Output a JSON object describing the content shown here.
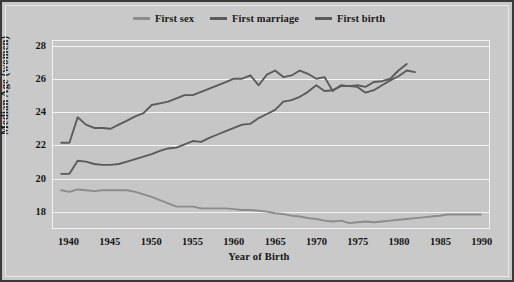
{
  "chart_data": {
    "type": "line",
    "title": "",
    "xlabel": "Year of Birth",
    "ylabel": "Median Age (women)",
    "xlim": [
      1938,
      1991
    ],
    "ylim": [
      16.9,
      28.3
    ],
    "yticks": [
      28,
      26,
      24,
      22,
      20,
      18
    ],
    "xticks": [
      1940,
      1945,
      1950,
      1955,
      1960,
      1965,
      1970,
      1975,
      1980,
      1985,
      1990
    ],
    "grid": "horizontal",
    "legend_position": "top-center",
    "colors": {
      "first_sex": "#8c8c8c",
      "first_marriage": "#5b5b5b",
      "first_birth": "#5b5b5b",
      "plot_background": "#c6c6c6",
      "figure_background": "#c9c9c9",
      "gridline": "#f4f4f4",
      "frame_border": "#3a3a3a",
      "text": "#161616"
    },
    "series": [
      {
        "name": "First sex",
        "color": "#8c8c8c",
        "x": [
          1939,
          1940,
          1941,
          1942,
          1943,
          1944,
          1945,
          1946,
          1947,
          1948,
          1949,
          1950,
          1951,
          1952,
          1953,
          1954,
          1955,
          1956,
          1957,
          1958,
          1959,
          1960,
          1961,
          1962,
          1963,
          1964,
          1965,
          1966,
          1967,
          1968,
          1969,
          1970,
          1971,
          1972,
          1973,
          1974,
          1975,
          1976,
          1977,
          1978,
          1979,
          1980,
          1981,
          1982,
          1983,
          1984,
          1985,
          1986,
          1987,
          1988,
          1989,
          1990
        ],
        "values": [
          19.2,
          19.1,
          19.25,
          19.2,
          19.15,
          19.2,
          19.2,
          19.2,
          19.2,
          19.1,
          18.95,
          18.8,
          18.6,
          18.4,
          18.2,
          18.2,
          18.2,
          18.1,
          18.1,
          18.1,
          18.1,
          18.05,
          18.0,
          18.0,
          17.95,
          17.9,
          17.8,
          17.75,
          17.65,
          17.6,
          17.5,
          17.45,
          17.35,
          17.3,
          17.35,
          17.2,
          17.25,
          17.3,
          17.25,
          17.3,
          17.35,
          17.4,
          17.45,
          17.5,
          17.55,
          17.6,
          17.65,
          17.72,
          17.72,
          17.72,
          17.72,
          17.72
        ]
      },
      {
        "name": "First marriage",
        "color": "#5b5b5b",
        "x": [
          1939,
          1940,
          1941,
          1942,
          1943,
          1944,
          1945,
          1946,
          1947,
          1948,
          1949,
          1950,
          1951,
          1952,
          1953,
          1954,
          1955,
          1956,
          1957,
          1958,
          1959,
          1960,
          1961,
          1962,
          1963,
          1964,
          1965,
          1966,
          1967,
          1968,
          1969,
          1970,
          1971,
          1972,
          1973,
          1974,
          1975,
          1976,
          1977,
          1978,
          1979,
          1980,
          1981,
          1982
        ],
        "values": [
          20.2,
          20.2,
          21.0,
          20.95,
          20.8,
          20.75,
          20.75,
          20.8,
          20.95,
          21.1,
          21.25,
          21.4,
          21.6,
          21.75,
          21.8,
          22.0,
          22.2,
          22.15,
          22.4,
          22.6,
          22.8,
          23.0,
          23.2,
          23.25,
          23.6,
          23.85,
          24.1,
          24.6,
          24.7,
          24.9,
          25.2,
          25.6,
          25.25,
          25.3,
          25.55,
          25.55,
          25.5,
          25.15,
          25.3,
          25.6,
          25.9,
          26.15,
          26.5,
          26.4
        ]
      },
      {
        "name": "First birth",
        "color": "#5b5b5b",
        "x": [
          1939,
          1940,
          1941,
          1942,
          1943,
          1944,
          1945,
          1946,
          1947,
          1948,
          1949,
          1950,
          1951,
          1952,
          1953,
          1954,
          1955,
          1956,
          1957,
          1958,
          1959,
          1960,
          1961,
          1962,
          1963,
          1964,
          1965,
          1966,
          1967,
          1968,
          1969,
          1970,
          1971,
          1972,
          1973,
          1974,
          1975,
          1976,
          1977,
          1978,
          1979,
          1980,
          1981
        ],
        "values": [
          22.1,
          22.1,
          23.65,
          23.2,
          23.0,
          23.0,
          22.95,
          23.2,
          23.45,
          23.7,
          23.9,
          24.4,
          24.5,
          24.6,
          24.8,
          25.0,
          25.0,
          25.2,
          25.4,
          25.6,
          25.8,
          26.0,
          26.0,
          26.2,
          25.6,
          26.25,
          26.5,
          26.1,
          26.2,
          26.5,
          26.3,
          26.0,
          26.1,
          25.25,
          25.6,
          25.55,
          25.6,
          25.5,
          25.8,
          25.85,
          26.0,
          26.5,
          26.9
        ]
      }
    ]
  },
  "legend": {
    "items": [
      {
        "label": "First sex"
      },
      {
        "label": "First marriage"
      },
      {
        "label": "First birth"
      }
    ]
  }
}
